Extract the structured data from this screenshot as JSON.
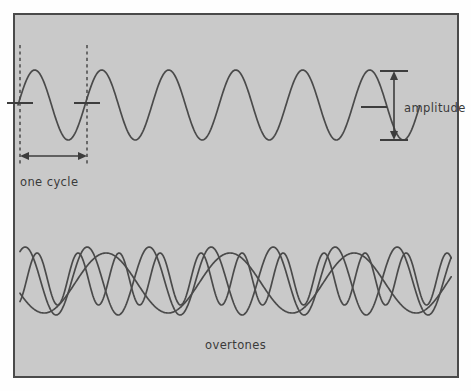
{
  "figure": {
    "title_visible": false,
    "background_color": "#fefefe",
    "panel_fill": "#c9c9c9",
    "stroke_color": "#4a4a4a",
    "text_color": "#3a3a3a",
    "frame": {
      "x": 13,
      "y": 13,
      "width": 445,
      "height": 364
    }
  },
  "labels": {
    "one_cycle": "one cycle",
    "amplitude": "amplitude",
    "overtones": "overtones"
  },
  "chart_data": {
    "type": "line",
    "title": "",
    "xlabel": "",
    "ylabel": "",
    "grid": false,
    "legend": "none",
    "annotations": [
      {
        "name": "one-cycle",
        "text": "one cycle",
        "kind": "horizontal-double-arrow",
        "x_start": 20,
        "x_end": 87,
        "y": 156,
        "label_x": 20,
        "label_y": 182
      },
      {
        "name": "amplitude",
        "text": "amplitude",
        "kind": "vertical-double-arrow",
        "x": 394,
        "y_top": 71,
        "y_bottom": 140,
        "label_x": 404,
        "label_y": 109
      },
      {
        "name": "overtones",
        "text": "overtones",
        "kind": "caption",
        "label_x": 205,
        "label_y": 345
      }
    ],
    "guides": {
      "dashed_verticals": [
        {
          "x": 20,
          "y_top": 45,
          "y_bottom": 166
        },
        {
          "x": 87,
          "y_top": 45,
          "y_bottom": 166
        }
      ],
      "zero_ticks": [
        {
          "x": 20,
          "y": 103,
          "half_width": 13
        },
        {
          "x": 87,
          "y": 103,
          "half_width": 13
        },
        {
          "x": 374,
          "y": 107,
          "half_width": 13
        }
      ],
      "amplitude_caps": [
        {
          "x": 394,
          "y": 71,
          "half_width": 14
        },
        {
          "x": 394,
          "y": 140,
          "half_width": 14
        }
      ]
    },
    "series": [
      {
        "name": "fundamental-sine",
        "panel": "top",
        "description": "Pure sine wave, six full cycles across the panel",
        "amplitude": 35,
        "baseline_y": 105,
        "period_px": 67,
        "phase_deg": 0,
        "x_start": 18,
        "x_end": 420,
        "cycles": 6,
        "peak_y": 70,
        "trough_y": 140
      },
      {
        "name": "overtone-1",
        "panel": "bottom",
        "description": "Lowest frequency component of the composite overtone display",
        "amplitude": 30,
        "baseline_y": 283,
        "period_px": 124,
        "phase_deg": 200,
        "x_start": 20,
        "x_end": 452
      },
      {
        "name": "overtone-2",
        "panel": "bottom",
        "description": "Mid frequency component of the composite overtone display",
        "amplitude": 34,
        "baseline_y": 281,
        "period_px": 62,
        "phase_deg": 60,
        "x_start": 20,
        "x_end": 452
      },
      {
        "name": "overtone-3",
        "panel": "bottom",
        "description": "Higher frequency component of the composite overtone display",
        "amplitude": 26,
        "baseline_y": 279,
        "period_px": 41,
        "phase_deg": 300,
        "x_start": 20,
        "x_end": 452
      }
    ],
    "axis_ranges": {
      "x": [
        13,
        458
      ],
      "y": [
        13,
        377
      ]
    }
  }
}
